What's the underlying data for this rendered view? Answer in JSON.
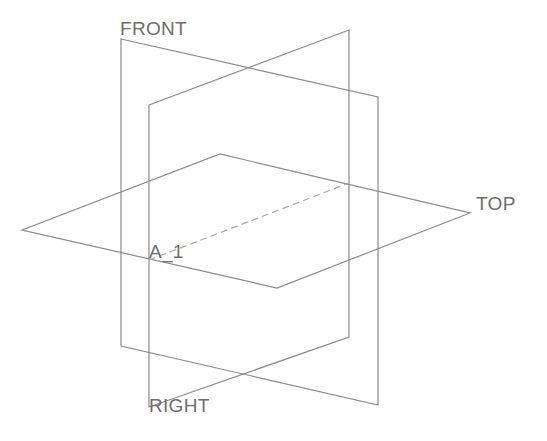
{
  "diagram": {
    "type": "cad-datum-planes",
    "colors": {
      "background": "#ffffff",
      "plane_stroke": "#8a8a8a",
      "axis_stroke": "#a8a8a8",
      "label_text": "#6e6e6e"
    },
    "planes": [
      {
        "name": "FRONT",
        "label": "FRONT",
        "label_pos": [
          120,
          19
        ],
        "points": [
          [
            121,
            39
          ],
          [
            378,
            97
          ],
          [
            378,
            405
          ],
          [
            121,
            346
          ]
        ]
      },
      {
        "name": "RIGHT",
        "label": "RIGHT",
        "label_pos": [
          149,
          396
        ],
        "points": [
          [
            149,
            105
          ],
          [
            349,
            30
          ],
          [
            349,
            337
          ],
          [
            149,
            407
          ]
        ]
      },
      {
        "name": "TOP",
        "label": "TOP",
        "label_pos": [
          476,
          194
        ],
        "points": [
          [
            22,
            230
          ],
          [
            220,
            154
          ],
          [
            470,
            213
          ],
          [
            277,
            288
          ]
        ]
      }
    ],
    "axes": [
      {
        "name": "A_1",
        "label": "A_1",
        "label_pos": [
          149,
          242
        ],
        "from": [
          149,
          260
        ],
        "to": [
          349,
          183
        ]
      }
    ]
  }
}
